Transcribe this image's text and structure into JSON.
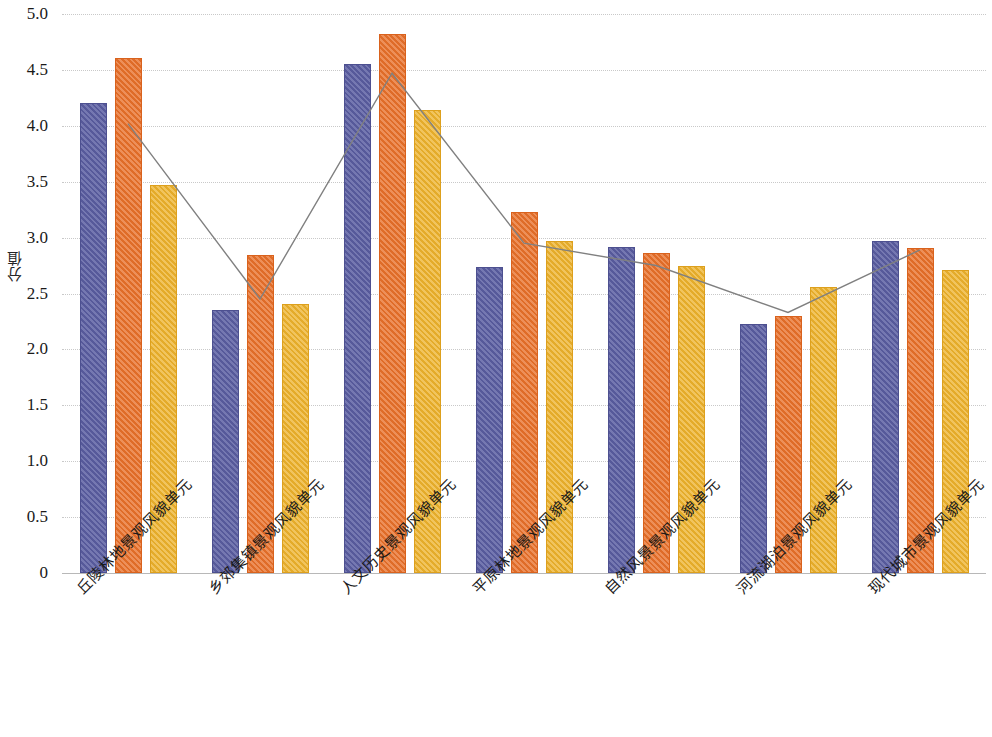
{
  "chart_data": {
    "type": "bar",
    "title": "",
    "subtitle": "",
    "xlabel": "",
    "ylabel": "分值",
    "ylim": [
      0,
      5.0
    ],
    "ytick_labels": [
      "5.0",
      "4.5",
      "4.0",
      "3.5",
      "3.0",
      "2.5",
      "2.0",
      "1.5",
      "1.0",
      "0.5",
      "0"
    ],
    "ytick_values": [
      5.0,
      4.5,
      4.0,
      3.5,
      3.0,
      2.5,
      2.0,
      1.5,
      1.0,
      0.5,
      0
    ],
    "grid": true,
    "legend": "none",
    "categories": [
      "丘陵林地景观风貌单元",
      "乡郊集镇景观风貌单元",
      "人文历史景观风貌单元",
      "平原林地景观风貌单元",
      "自然风景景观风貌单元",
      "河流湖泊景观风貌单元",
      "现代城市景观风貌单元"
    ],
    "series": [
      {
        "name": "series-1",
        "type": "bar",
        "color": "#5b5ea2",
        "values": [
          4.2,
          2.35,
          4.55,
          2.74,
          2.92,
          2.23,
          2.97
        ]
      },
      {
        "name": "series-2",
        "type": "bar",
        "color": "#e8702a",
        "values": [
          4.61,
          2.84,
          4.82,
          3.23,
          2.86,
          2.3,
          2.91
        ]
      },
      {
        "name": "series-3",
        "type": "bar",
        "color": "#edb22c",
        "values": [
          3.47,
          2.41,
          4.14,
          2.97,
          2.75,
          2.56,
          2.71
        ]
      },
      {
        "name": "series-4",
        "type": "line",
        "color": "#808080",
        "values": [
          4.02,
          2.45,
          4.47,
          2.95,
          2.75,
          2.33,
          2.89
        ]
      }
    ]
  }
}
